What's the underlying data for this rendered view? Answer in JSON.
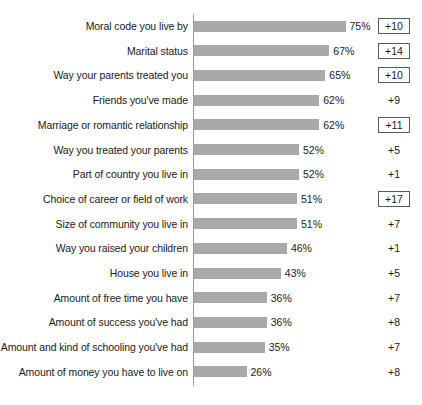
{
  "chart_data": {
    "type": "bar",
    "title": "",
    "subtitle": "",
    "xlabel": "",
    "ylabel": "",
    "orientation": "horizontal",
    "grid": false,
    "legend": "none",
    "xlim": [
      0,
      100
    ],
    "value_suffix": "%",
    "axis_baseline": 0,
    "categories": [
      "Moral code you live by",
      "Marital status",
      "Way your parents treated you",
      "Friends you've made",
      "Marriage or romantic relationship",
      "Way you treated your parents",
      "Part of country you live in",
      "Choice of career or field of work",
      "Size of community you live in",
      "Way you raised your children",
      "House you live in",
      "Amount of free time you have",
      "Amount of success you've had",
      "Amount and kind of schooling you've had",
      "Amount of money you have to live on"
    ],
    "values": [
      75,
      67,
      65,
      62,
      62,
      52,
      52,
      51,
      51,
      46,
      43,
      36,
      36,
      35,
      26
    ],
    "value_labels": [
      "75%",
      "67%",
      "65%",
      "62%",
      "62%",
      "52%",
      "52%",
      "51%",
      "51%",
      "46%",
      "43%",
      "36%",
      "36%",
      "35%",
      "26%"
    ],
    "series": [
      {
        "name": "Percent",
        "values": [
          75,
          67,
          65,
          62,
          62,
          52,
          52,
          51,
          51,
          46,
          43,
          36,
          36,
          35,
          26
        ],
        "color": "#a9a9a9"
      }
    ],
    "annotations": {
      "name": "change",
      "labels": [
        "+10",
        "+14",
        "+10",
        "+9",
        "+11",
        "+5",
        "+1",
        "+17",
        "+7",
        "+1",
        "+5",
        "+7",
        "+8",
        "+7",
        "+8"
      ],
      "values": [
        10,
        14,
        10,
        9,
        11,
        5,
        1,
        17,
        7,
        1,
        5,
        7,
        8,
        7,
        8
      ],
      "boxed": [
        true,
        true,
        true,
        false,
        true,
        false,
        false,
        true,
        false,
        false,
        false,
        false,
        false,
        false,
        false
      ]
    }
  },
  "rows": [
    {
      "label": "Moral code you live by",
      "value": 75,
      "value_label": "75%",
      "delta": "+10",
      "boxed": true
    },
    {
      "label": "Marital status",
      "value": 67,
      "value_label": "67%",
      "delta": "+14",
      "boxed": true
    },
    {
      "label": "Way your parents treated you",
      "value": 65,
      "value_label": "65%",
      "delta": "+10",
      "boxed": true
    },
    {
      "label": "Friends you've made",
      "value": 62,
      "value_label": "62%",
      "delta": "+9",
      "boxed": false
    },
    {
      "label": "Marriage or romantic relationship",
      "value": 62,
      "value_label": "62%",
      "delta": "+11",
      "boxed": true
    },
    {
      "label": "Way you treated your parents",
      "value": 52,
      "value_label": "52%",
      "delta": "+5",
      "boxed": false
    },
    {
      "label": "Part of country you live in",
      "value": 52,
      "value_label": "52%",
      "delta": "+1",
      "boxed": false
    },
    {
      "label": "Choice of career or field of work",
      "value": 51,
      "value_label": "51%",
      "delta": "+17",
      "boxed": true
    },
    {
      "label": "Size of community you live in",
      "value": 51,
      "value_label": "51%",
      "delta": "+7",
      "boxed": false
    },
    {
      "label": "Way you raised your children",
      "value": 46,
      "value_label": "46%",
      "delta": "+1",
      "boxed": false
    },
    {
      "label": "House you live in",
      "value": 43,
      "value_label": "43%",
      "delta": "+5",
      "boxed": false
    },
    {
      "label": "Amount of free time you have",
      "value": 36,
      "value_label": "36%",
      "delta": "+7",
      "boxed": false
    },
    {
      "label": "Amount of success you've had",
      "value": 36,
      "value_label": "36%",
      "delta": "+8",
      "boxed": false
    },
    {
      "label": "Amount and kind of schooling you've had",
      "value": 35,
      "value_label": "35%",
      "delta": "+7",
      "boxed": false
    },
    {
      "label": "Amount of money you have to live on",
      "value": 26,
      "value_label": "26%",
      "delta": "+8",
      "boxed": false
    }
  ],
  "style": {
    "bar_color": "#a9a9a9",
    "text_color": "#1a1a1a",
    "axis_color": "#9a9a9a",
    "box_border_color": "#5a5a5a",
    "background": "#ffffff"
  },
  "layout": {
    "axis_x": 193,
    "row_top": 14,
    "row_pitch": 24.7,
    "px_per_unit": 2.02
  }
}
